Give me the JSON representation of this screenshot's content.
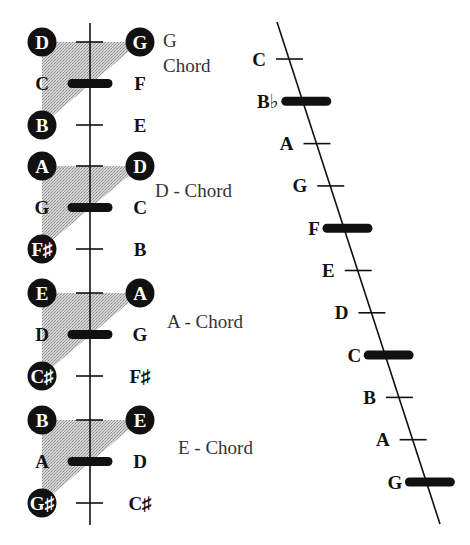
{
  "colors": {
    "ink": "#111111",
    "shade": "#bdbdbd",
    "label": "#333333",
    "circle_text": "#ffffff"
  },
  "left_groups": [
    {
      "chord_label_lines": [
        "G",
        "Chord"
      ],
      "rows": [
        {
          "left": "D",
          "left_circled": true,
          "mark": "tick",
          "right": "G",
          "right_circled": true
        },
        {
          "left": "C",
          "left_circled": false,
          "mark": "bar",
          "right": "F",
          "right_circled": false
        },
        {
          "left": "B",
          "left_circled": true,
          "mark": "tick",
          "right": "E",
          "right_circled": false
        }
      ]
    },
    {
      "chord_label_lines": [
        "D - Chord"
      ],
      "rows": [
        {
          "left": "A",
          "left_circled": true,
          "mark": "tick",
          "right": "D",
          "right_circled": true
        },
        {
          "left": "G",
          "left_circled": false,
          "mark": "bar",
          "right": "C",
          "right_circled": false
        },
        {
          "left": "F♯",
          "left_circled": true,
          "mark": "tick",
          "right": "B",
          "right_circled": false
        }
      ]
    },
    {
      "chord_label_lines": [
        "A - Chord"
      ],
      "rows": [
        {
          "left": "E",
          "left_circled": true,
          "mark": "tick",
          "right": "A",
          "right_circled": true
        },
        {
          "left": "D",
          "left_circled": false,
          "mark": "bar",
          "right": "G",
          "right_circled": false
        },
        {
          "left": "C♯",
          "left_circled": true,
          "mark": "tick",
          "right": "F♯",
          "right_circled": false
        }
      ]
    },
    {
      "chord_label_lines": [
        "E - Chord"
      ],
      "rows": [
        {
          "left": "B",
          "left_circled": true,
          "mark": "tick",
          "right": "E",
          "right_circled": true
        },
        {
          "left": "A",
          "left_circled": false,
          "mark": "bar",
          "right": "D",
          "right_circled": false
        },
        {
          "left": "G♯",
          "left_circled": true,
          "mark": "tick",
          "right": "C♯",
          "right_circled": false
        }
      ]
    }
  ],
  "diagonal_notes": [
    {
      "label": "C",
      "mark": "tick"
    },
    {
      "label": "B♭",
      "mark": "bar"
    },
    {
      "label": "A",
      "mark": "tick"
    },
    {
      "label": "G",
      "mark": "tick"
    },
    {
      "label": "F",
      "mark": "bar"
    },
    {
      "label": "E",
      "mark": "tick"
    },
    {
      "label": "D",
      "mark": "tick"
    },
    {
      "label": "C",
      "mark": "bar"
    },
    {
      "label": "B",
      "mark": "tick"
    },
    {
      "label": "A",
      "mark": "tick"
    },
    {
      "label": "G",
      "mark": "bar"
    }
  ]
}
